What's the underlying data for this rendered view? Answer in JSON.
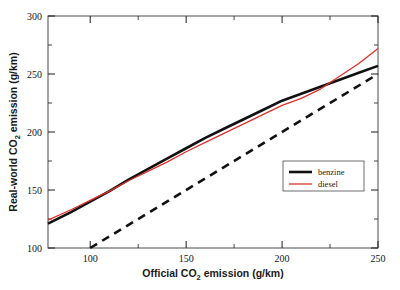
{
  "chart_data": {
    "type": "line",
    "title": "",
    "xlabel": "Official CO2 emission (g/km)",
    "xlabel_main": "Official CO",
    "xlabel_sub": "2",
    "xlabel_rest": " emission (g/km)",
    "ylabel": "Real-world CO2 emission (g/km)",
    "ylabel_main": "Real-world CO",
    "ylabel_sub": "2",
    "ylabel_rest": " emission (g/km)",
    "xlim": [
      78,
      250
    ],
    "ylim": [
      100,
      300
    ],
    "xticks": [
      100,
      150,
      200,
      250
    ],
    "xtick_labels": [
      "100",
      "150",
      "200",
      "250"
    ],
    "yticks": [
      100,
      150,
      200,
      250,
      300
    ],
    "ytick_labels": [
      "100",
      "150",
      "200",
      "250",
      "300"
    ],
    "xminor_ticks": [
      125,
      175,
      225
    ],
    "yminor_ticks": [
      125,
      175,
      225,
      275
    ],
    "grid": false,
    "legend_position": "lower-right",
    "series": [
      {
        "name": "benzine",
        "color": "#111111",
        "style": "solid",
        "width": 2.6,
        "x": [
          78,
          90,
          100,
          110,
          120,
          130,
          140,
          150,
          160,
          170,
          180,
          190,
          200,
          210,
          220,
          230,
          240,
          250
        ],
        "y": [
          121,
          131,
          140,
          149,
          159,
          168,
          177,
          186,
          195,
          203,
          211,
          219,
          227,
          233,
          239,
          245,
          251,
          257
        ]
      },
      {
        "name": "diesel",
        "color": "#e0302a",
        "style": "solid",
        "width": 1.3,
        "x": [
          78,
          90,
          100,
          110,
          120,
          130,
          140,
          150,
          160,
          170,
          180,
          190,
          200,
          210,
          220,
          230,
          240,
          250
        ],
        "y": [
          124,
          133,
          141,
          149,
          158,
          166,
          174,
          183,
          191,
          199,
          207,
          215,
          223,
          229,
          237,
          248,
          259,
          272
        ]
      },
      {
        "name": "parity",
        "color": "#111111",
        "style": "dashed",
        "width": 2.6,
        "x": [
          100,
          250
        ],
        "y": [
          100,
          250
        ]
      }
    ],
    "legend": [
      {
        "label": "benzine",
        "color": "#111111",
        "style": "solid",
        "width": 2.6
      },
      {
        "label": "diesel",
        "color": "#e0302a",
        "style": "solid",
        "width": 1.3
      }
    ]
  },
  "colors": {
    "axis": "#1a1a1a",
    "background": "#ffffff",
    "benzine": "#111111",
    "diesel": "#e0302a"
  }
}
